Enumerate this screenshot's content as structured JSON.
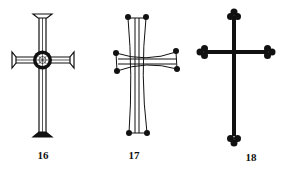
{
  "figure": {
    "items": [
      {
        "label": "16",
        "description": "cross with double-line arms, flared serif ends, and central wheel medallion"
      },
      {
        "label": "17",
        "description": "cross with concave double-line arms terminating in dots"
      },
      {
        "label": "18",
        "description": "solid cross with trefoil (budded) ends"
      }
    ]
  },
  "colors": {
    "ink": "#111111",
    "background": "#ffffff"
  }
}
